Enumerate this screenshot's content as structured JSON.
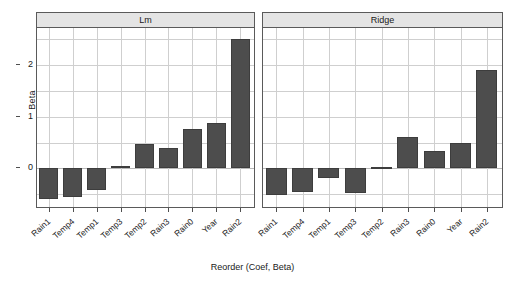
{
  "chart_data": {
    "type": "bar",
    "title": "",
    "xlabel": "Reorder (Coef, Beta)",
    "ylabel": "Beta",
    "ylim": [
      -0.75,
      2.72
    ],
    "yticks": [
      0,
      1,
      2
    ],
    "ytick_labels": [
      "0",
      "1",
      "2"
    ],
    "grid": true,
    "legend": "none",
    "panel_layout": "1x2 trellis",
    "categories": [
      "Rain1",
      "Temp4",
      "Temp1",
      "Temp3",
      "Temp2",
      "Rain3",
      "Rain0",
      "Year",
      "Rain2"
    ],
    "series": [
      {
        "name": "Lm",
        "panel_title": "Lm",
        "values": [
          -0.6,
          -0.56,
          -0.42,
          0.04,
          0.48,
          0.4,
          0.76,
          0.87,
          2.51
        ]
      },
      {
        "name": "Ridge",
        "panel_title": "Ridge",
        "values": [
          -0.52,
          -0.45,
          -0.18,
          -0.48,
          0.02,
          0.6,
          0.33,
          0.49,
          1.9
        ]
      }
    ],
    "bar_color": "#4d4d4d",
    "strip_color": "#e4e4e4",
    "grid_color": "#cfcfcf",
    "frame_color": "#5a5a5a"
  },
  "axes": {
    "y_label": "Beta",
    "x_label": "Reorder (Coef, Beta)",
    "y_tick_labels": [
      "2",
      "1",
      "0"
    ]
  },
  "panels": [
    {
      "title": "Lm"
    },
    {
      "title": "Ridge"
    }
  ]
}
